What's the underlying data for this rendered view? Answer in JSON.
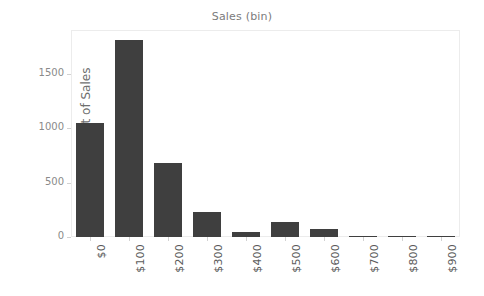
{
  "chart_data": {
    "type": "bar",
    "title": "Sales (bin)",
    "xlabel": "",
    "ylabel": "Count of Sales",
    "categories": [
      "$0",
      "$100",
      "$200",
      "$300",
      "$400",
      "$500",
      "$600",
      "$700",
      "$800",
      "$900"
    ],
    "values": [
      1050,
      1810,
      675,
      230,
      50,
      140,
      75,
      12,
      4,
      3
    ],
    "ylim": [
      0,
      1900
    ],
    "yticks": [
      0,
      500,
      1000,
      1500
    ],
    "ytick_labels": [
      "0",
      "500",
      "1000",
      "1500"
    ],
    "grid": false,
    "legend": null,
    "bar_color": "#3f3f3f",
    "axis_color": "#d2d2d2",
    "tick_text_color": "#8a8a8a",
    "title_color": "#7b7b7b",
    "background": "#ffffff"
  }
}
